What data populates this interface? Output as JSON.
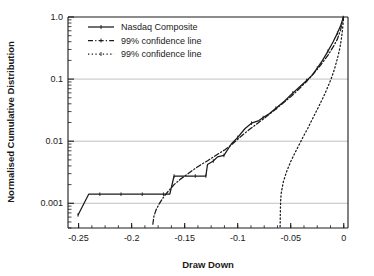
{
  "chart_data": {
    "type": "line",
    "title": "",
    "xlabel": "Draw Down",
    "ylabel": "Normalised Cumulative Distribution",
    "xlim": [
      -0.26,
      0.004
    ],
    "ylim": [
      0.0004,
      1.0
    ],
    "yscale": "log",
    "xscale": "linear",
    "grid": "horizontal-major",
    "legend_position": "top-left",
    "xticks": [
      -0.25,
      -0.2,
      -0.15,
      -0.1,
      -0.05,
      0
    ],
    "xticklabels": [
      "-0.25",
      "-0.2",
      "-0.15",
      "-0.1",
      "-0.05",
      "0"
    ],
    "yticks": [
      1.0,
      0.1,
      0.01,
      0.001
    ],
    "yticklabels": [
      "1.0",
      "0.1",
      "0.01",
      "0.001"
    ],
    "series": [
      {
        "name": "Nasdaq Composite",
        "style": "solid",
        "marker": "tick",
        "points": [
          [
            -0.2505,
            0.00065
          ],
          [
            -0.2405,
            0.0014
          ],
          [
            -0.23,
            0.0014
          ],
          [
            -0.22,
            0.0014
          ],
          [
            -0.21,
            0.0014
          ],
          [
            -0.2,
            0.0014
          ],
          [
            -0.19,
            0.0014
          ],
          [
            -0.18,
            0.0014
          ],
          [
            -0.17,
            0.0014
          ],
          [
            -0.164,
            0.0014
          ],
          [
            -0.16,
            0.00275
          ],
          [
            -0.15,
            0.00275
          ],
          [
            -0.14,
            0.00275
          ],
          [
            -0.133,
            0.00275
          ],
          [
            -0.13,
            0.00275
          ],
          [
            -0.1285,
            0.0042
          ],
          [
            -0.123,
            0.0048
          ],
          [
            -0.119,
            0.0056
          ],
          [
            -0.113,
            0.0059
          ],
          [
            -0.106,
            0.009
          ],
          [
            -0.1,
            0.0115
          ],
          [
            -0.093,
            0.016
          ],
          [
            -0.087,
            0.0195
          ],
          [
            -0.08,
            0.0215
          ],
          [
            -0.076,
            0.024
          ],
          [
            -0.07,
            0.028
          ],
          [
            -0.064,
            0.034
          ],
          [
            -0.056,
            0.044
          ],
          [
            -0.048,
            0.06
          ],
          [
            -0.042,
            0.074
          ],
          [
            -0.035,
            0.095
          ],
          [
            -0.03,
            0.115
          ],
          [
            -0.025,
            0.15
          ],
          [
            -0.02,
            0.2
          ],
          [
            -0.015,
            0.28
          ],
          [
            -0.01,
            0.4
          ],
          [
            -0.006,
            0.55
          ],
          [
            -0.003,
            0.72
          ],
          [
            -0.0005,
            0.98
          ]
        ]
      },
      {
        "name": "99% confidence line",
        "style": "dashdot",
        "marker": "tick",
        "points": [
          [
            -0.18,
            0.00046
          ],
          [
            -0.179,
            0.00062
          ],
          [
            -0.177,
            0.00078
          ],
          [
            -0.174,
            0.00098
          ],
          [
            -0.17,
            0.00125
          ],
          [
            -0.165,
            0.0016
          ],
          [
            -0.16,
            0.002
          ],
          [
            -0.154,
            0.00245
          ],
          [
            -0.148,
            0.0029
          ],
          [
            -0.142,
            0.00345
          ],
          [
            -0.135,
            0.00415
          ],
          [
            -0.128,
            0.0049
          ],
          [
            -0.12,
            0.006
          ],
          [
            -0.112,
            0.0073
          ],
          [
            -0.105,
            0.009
          ],
          [
            -0.098,
            0.0115
          ],
          [
            -0.09,
            0.015
          ],
          [
            -0.082,
            0.019
          ],
          [
            -0.074,
            0.024
          ],
          [
            -0.066,
            0.031
          ],
          [
            -0.058,
            0.04
          ],
          [
            -0.05,
            0.052
          ],
          [
            -0.042,
            0.07
          ],
          [
            -0.035,
            0.092
          ],
          [
            -0.028,
            0.125
          ],
          [
            -0.021,
            0.175
          ],
          [
            -0.015,
            0.24
          ],
          [
            -0.01,
            0.33
          ],
          [
            -0.006,
            0.44
          ],
          [
            -0.003,
            0.62
          ],
          [
            -0.0005,
            0.97
          ]
        ]
      },
      {
        "name": "99% confidence line",
        "style": "dotted",
        "marker": "tick",
        "points": [
          [
            -0.06,
            0.00042
          ],
          [
            -0.0598,
            0.0007
          ],
          [
            -0.0595,
            0.0011
          ],
          [
            -0.059,
            0.00145
          ],
          [
            -0.057,
            0.0022
          ],
          [
            -0.054,
            0.0032
          ],
          [
            -0.05,
            0.0047
          ],
          [
            -0.046,
            0.0065
          ],
          [
            -0.042,
            0.0088
          ],
          [
            -0.038,
            0.012
          ],
          [
            -0.034,
            0.016
          ],
          [
            -0.03,
            0.022
          ],
          [
            -0.026,
            0.03
          ],
          [
            -0.022,
            0.041
          ],
          [
            -0.018,
            0.057
          ],
          [
            -0.015,
            0.075
          ],
          [
            -0.012,
            0.1
          ],
          [
            -0.009,
            0.14
          ],
          [
            -0.007,
            0.185
          ],
          [
            -0.005,
            0.25
          ],
          [
            -0.0035,
            0.33
          ],
          [
            -0.0022,
            0.45
          ],
          [
            -0.0012,
            0.62
          ],
          [
            -0.0005,
            0.85
          ],
          [
            -0.0001,
            1.0
          ]
        ]
      }
    ],
    "colors": {
      "line": "#1a1a1a",
      "grid": "#b9b9b9",
      "axis": "#1a1a1a",
      "background": "#ffffff"
    }
  },
  "legend": {
    "entries": [
      {
        "label": "Nasdaq Composite"
      },
      {
        "label": "99% confidence line"
      },
      {
        "label": "99% confidence line"
      }
    ]
  }
}
